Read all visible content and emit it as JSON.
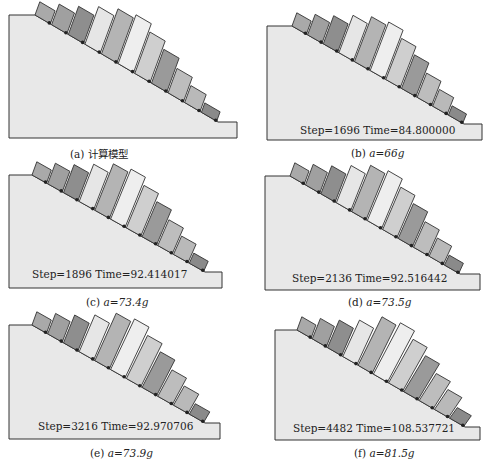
{
  "figure": {
    "panels": [
      {
        "id": "a",
        "label": "(a)",
        "caption": "计算模型",
        "step_text": ""
      },
      {
        "id": "b",
        "label": "(b)",
        "caption": "a=66g",
        "step_text": "Step=1696 Time=84.800000"
      },
      {
        "id": "c",
        "label": "(c)",
        "caption": "a=73.4g",
        "step_text": "Step=1896 Time=92.414017"
      },
      {
        "id": "d",
        "label": "(d)",
        "caption": "a=73.5g",
        "step_text": "Step=2136 Time=92.516442"
      },
      {
        "id": "e",
        "label": "(e)",
        "caption": "a=73.9g",
        "step_text": "Step=3216 Time=92.970706"
      },
      {
        "id": "f",
        "label": "(f)",
        "caption": "a=81.5g",
        "step_text": "Step=4482 Time=108.537721"
      }
    ],
    "block_shades": [
      "#a9a9a9",
      "#a0a0a0",
      "#8e8e8e",
      "#e6e6e6",
      "#b4b4b4",
      "#eeeeee",
      "#cfcfcf",
      "#9a9a9a",
      "#bdbdbd",
      "#b9b9b9",
      "#8a8a8a"
    ],
    "slope_fill": "#e8e8e8",
    "outline": "#333333"
  }
}
